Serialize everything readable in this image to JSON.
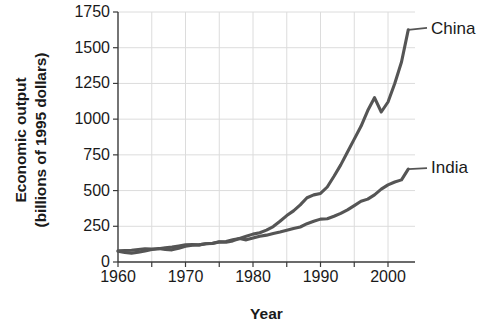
{
  "chart_data": {
    "type": "line",
    "title": "",
    "xlabel": "Year",
    "ylabel_line1": "Economic output",
    "ylabel_line2": "(billions of 1995 dollars)",
    "xlim": [
      1960,
      2004
    ],
    "ylim": [
      0,
      1750
    ],
    "xticks": [
      1960,
      1970,
      1980,
      1990,
      2000
    ],
    "xticklabels": [
      "1960",
      "1970",
      "1980",
      "1990",
      "2000"
    ],
    "yticks": [
      0,
      250,
      500,
      750,
      1000,
      1250,
      1500,
      1750
    ],
    "yticklabels": [
      "0",
      "250",
      "500",
      "750",
      "1000",
      "1250",
      "1500",
      "1750"
    ],
    "grid": true,
    "grid_color": "#dcdcdc",
    "line_color": "#555555",
    "legend_position": "right-inline-labels",
    "series": [
      {
        "name": "China",
        "label": "China",
        "x": [
          1960,
          1961,
          1962,
          1963,
          1964,
          1965,
          1966,
          1967,
          1968,
          1969,
          1970,
          1971,
          1972,
          1973,
          1974,
          1975,
          1976,
          1977,
          1978,
          1979,
          1980,
          1981,
          1982,
          1983,
          1984,
          1985,
          1986,
          1987,
          1988,
          1989,
          1990,
          1991,
          1992,
          1993,
          1994,
          1995,
          1996,
          1997,
          1998,
          1999,
          2000,
          2001,
          2002,
          2003
        ],
        "values": [
          75,
          66,
          62,
          68,
          78,
          88,
          95,
          88,
          85,
          96,
          110,
          117,
          120,
          128,
          130,
          140,
          138,
          148,
          165,
          180,
          195,
          205,
          223,
          248,
          285,
          325,
          358,
          400,
          450,
          470,
          480,
          525,
          600,
          680,
          770,
          860,
          950,
          1060,
          1150,
          1050,
          1120,
          1250,
          1400,
          1625
        ]
      },
      {
        "name": "India",
        "label": "India",
        "x": [
          1960,
          1961,
          1962,
          1963,
          1964,
          1965,
          1966,
          1967,
          1968,
          1969,
          1970,
          1971,
          1972,
          1973,
          1974,
          1975,
          1976,
          1977,
          1978,
          1979,
          1980,
          1981,
          1982,
          1983,
          1984,
          1985,
          1986,
          1987,
          1988,
          1989,
          1990,
          1991,
          1992,
          1993,
          1994,
          1995,
          1996,
          1997,
          1998,
          1999,
          2000,
          2001,
          2002,
          2003
        ],
        "values": [
          78,
          80,
          82,
          87,
          93,
          90,
          93,
          100,
          104,
          112,
          120,
          122,
          120,
          128,
          131,
          142,
          144,
          155,
          165,
          155,
          168,
          180,
          188,
          200,
          210,
          222,
          235,
          245,
          268,
          285,
          300,
          303,
          320,
          340,
          365,
          395,
          425,
          440,
          470,
          510,
          540,
          560,
          575,
          650
        ]
      }
    ]
  }
}
